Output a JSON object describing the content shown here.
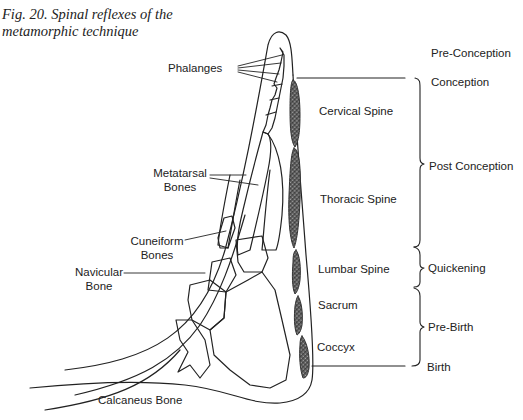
{
  "caption": {
    "line1": "Fig. 20. Spinal reflexes of the",
    "line2": "metamorphic technique"
  },
  "bone_labels": {
    "phalanges": "Phalanges",
    "metatarsal_1": "Metatarsal",
    "metatarsal_2": "Bones",
    "cuneiform_1": "Cuneiform",
    "cuneiform_2": "Bones",
    "navicular_1": "Navicular",
    "navicular_2": "Bone",
    "calcaneus": "Calcaneus  Bone"
  },
  "spine_labels": {
    "cervical": "Cervical Spine",
    "thoracic": "Thoracic Spine",
    "lumbar": "Lumbar Spine",
    "sacrum": "Sacrum",
    "coccyx": "Coccyx"
  },
  "stage_labels": {
    "pre_conception": "Pre-Conception",
    "conception": "Conception",
    "post_conception": "Post Conception",
    "quickening": "Quickening",
    "pre_birth": "Pre-Birth",
    "birth": "Birth"
  },
  "colors": {
    "line": "#222222",
    "shading": "#9a9a9a"
  }
}
